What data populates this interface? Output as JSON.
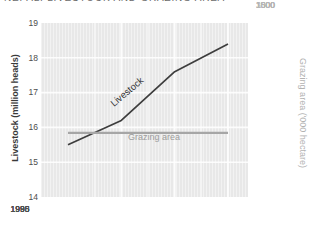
{
  "title": "NEPAL: LIVESTOCK AND GRAZING AREA",
  "left_axis": {
    "title": "Livestock (million heads)",
    "ticks": [
      "19",
      "18",
      "17",
      "16",
      "15",
      "14"
    ]
  },
  "right_axis": {
    "title": "Grazing area ('000 hectare)",
    "ticks": [
      "3000",
      "1500",
      "1500",
      "1500",
      "1000"
    ]
  },
  "x_axis": {
    "ticks": [
      "1985",
      "1990",
      "1995",
      "1998"
    ]
  },
  "colors": {
    "plot_background": "#e8e8e8",
    "gridline": "#ffffff",
    "livestock_line": "#3d3d3d",
    "grazing_line": "#a6a6a6",
    "left_axis_text": "#4d4d4d",
    "right_axis_text": "#b5b5b5",
    "title_text": "#6b6b6b"
  },
  "chart_data": {
    "type": "line",
    "title": "NEPAL: LIVESTOCK AND GRAZING AREA",
    "x": [
      1985,
      1990,
      1995,
      1998
    ],
    "x_tick_labels": [
      "1985",
      "1990",
      "1995",
      "1998"
    ],
    "left_axis": {
      "label": "Livestock (million heads)",
      "range": [
        14,
        19
      ],
      "tick_step": 1
    },
    "right_axis": {
      "label": "Grazing area ('000 hectare)",
      "range": [
        1000,
        3000
      ],
      "tick_labels_shown": [
        "3000",
        "1500",
        "1500",
        "1500",
        "1000"
      ]
    },
    "series": [
      {
        "name": "Livestock",
        "axis": "left",
        "unit": "million heads",
        "values": [
          15.5,
          16.2,
          17.6,
          18.4
        ],
        "color": "#3d3d3d"
      },
      {
        "name": "Grazing area",
        "axis": "right",
        "unit": "'000 hectare",
        "values": [
          1700,
          1700,
          1700,
          1700
        ],
        "color": "#a6a6a6"
      }
    ],
    "grid": true,
    "legend": "inline-line-labels"
  }
}
